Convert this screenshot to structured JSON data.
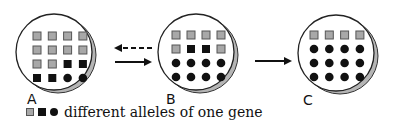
{
  "colors": {
    "gray_allele": "#a8a8a8",
    "black": "#111111",
    "shadow": "#b5b5b5",
    "outline": "#222222"
  },
  "populations": [
    {
      "label": "A",
      "grid": [
        [
          "gray-square",
          "gray-square",
          "gray-square",
          "gray-square"
        ],
        [
          "gray-square",
          "gray-square",
          "gray-square",
          "gray-square"
        ],
        [
          "gray-square",
          "gray-square",
          "black-square",
          "black-square"
        ],
        [
          "black-square",
          "black-square",
          "black-circle",
          "black-circle"
        ]
      ]
    },
    {
      "label": "B",
      "grid": [
        [
          "gray-square",
          "gray-square",
          "gray-square",
          "gray-square"
        ],
        [
          "gray-square",
          "black-square",
          "black-square",
          "gray-square"
        ],
        [
          "black-circle",
          "black-circle",
          "black-circle",
          "black-circle"
        ],
        [
          "black-circle",
          "black-circle",
          "black-circle",
          "black-circle"
        ]
      ]
    },
    {
      "label": "C",
      "grid": [
        [
          "gray-square",
          "gray-square",
          "gray-square",
          "gray-square"
        ],
        [
          "black-circle",
          "black-circle",
          "black-circle",
          "black-circle"
        ],
        [
          "black-circle",
          "black-circle",
          "black-circle",
          "black-circle"
        ],
        [
          "black-circle",
          "black-circle",
          "black-circle",
          "black-circle"
        ]
      ]
    }
  ],
  "arrows": [
    {
      "from": "B",
      "to": "A",
      "style": "dashed"
    },
    {
      "from": "A",
      "to": "B",
      "style": "solid"
    },
    {
      "from": "B",
      "to": "C",
      "style": "solid"
    }
  ],
  "legend": {
    "symbols": [
      "gray-square",
      "black-square",
      "black-circle"
    ],
    "text": "different alleles of one gene"
  }
}
